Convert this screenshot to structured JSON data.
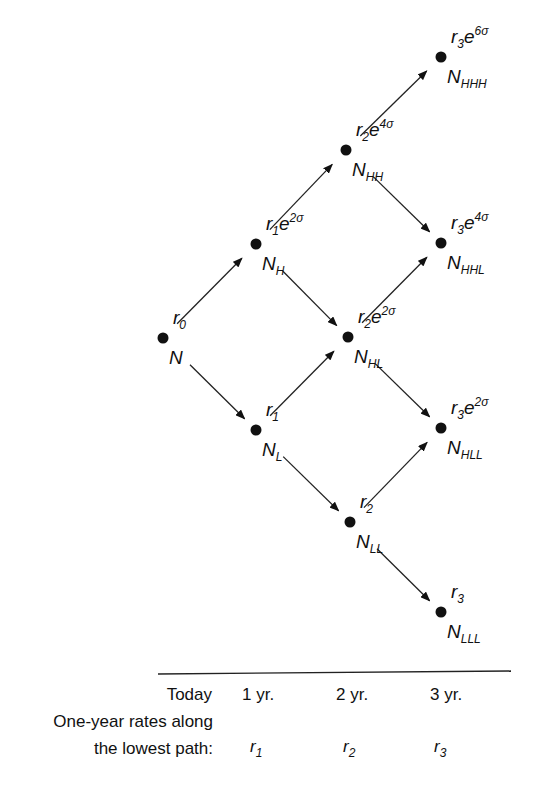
{
  "diagram": {
    "type": "binomial interest rate tree",
    "nodes": [
      {
        "id": "N",
        "rate_base": "r",
        "rate_sub": "0",
        "rate_exp": "",
        "node_label": "N",
        "node_sub": "",
        "x": 163,
        "y": 338
      },
      {
        "id": "NH",
        "rate_base": "r",
        "rate_sub": "1",
        "rate_exp": "2σ",
        "node_label": "N",
        "node_sub": "H",
        "x": 256,
        "y": 244
      },
      {
        "id": "NL",
        "rate_base": "r",
        "rate_sub": "1",
        "rate_exp": "",
        "node_label": "N",
        "node_sub": "L",
        "x": 256,
        "y": 430
      },
      {
        "id": "NHH",
        "rate_base": "r",
        "rate_sub": "2",
        "rate_exp": "4σ",
        "node_label": "N",
        "node_sub": "HH",
        "x": 346,
        "y": 150
      },
      {
        "id": "NHL",
        "rate_base": "r",
        "rate_sub": "2",
        "rate_exp": "2σ",
        "node_label": "N",
        "node_sub": "HL",
        "x": 348,
        "y": 337
      },
      {
        "id": "NLL",
        "rate_base": "r",
        "rate_sub": "2",
        "rate_exp": "",
        "node_label": "N",
        "node_sub": "LL",
        "x": 350,
        "y": 522
      },
      {
        "id": "NHHH",
        "rate_base": "r",
        "rate_sub": "3",
        "rate_exp": "6σ",
        "node_label": "N",
        "node_sub": "HHH",
        "x": 441,
        "y": 57
      },
      {
        "id": "NHHL",
        "rate_base": "r",
        "rate_sub": "3",
        "rate_exp": "4σ",
        "node_label": "N",
        "node_sub": "HHL",
        "x": 441,
        "y": 243
      },
      {
        "id": "NHLL",
        "rate_base": "r",
        "rate_sub": "3",
        "rate_exp": "2σ",
        "node_label": "N",
        "node_sub": "HLL",
        "x": 441,
        "y": 428
      },
      {
        "id": "NLLL",
        "rate_base": "r",
        "rate_sub": "3",
        "rate_exp": "",
        "node_label": "N",
        "node_sub": "LLL",
        "x": 441,
        "y": 612
      }
    ],
    "edges": [
      [
        "N",
        "NH"
      ],
      [
        "N",
        "NL"
      ],
      [
        "NH",
        "NHH"
      ],
      [
        "NH",
        "NHL"
      ],
      [
        "NL",
        "NHL"
      ],
      [
        "NL",
        "NLL"
      ],
      [
        "NHH",
        "NHHH"
      ],
      [
        "NHH",
        "NHHL"
      ],
      [
        "NHL",
        "NHHL"
      ],
      [
        "NHL",
        "NHLL"
      ],
      [
        "NLL",
        "NHLL"
      ],
      [
        "NLL",
        "NLLL"
      ]
    ]
  },
  "axis": {
    "periods": [
      "Today",
      "1 yr.",
      "2 yr.",
      "3 yr."
    ],
    "row_label_line1": "One-year rates along",
    "row_label_line2": "the lowest path:",
    "lowest_path_rates": [
      {
        "base": "r",
        "sub": "1"
      },
      {
        "base": "r",
        "sub": "2"
      },
      {
        "base": "r",
        "sub": "3"
      }
    ]
  }
}
